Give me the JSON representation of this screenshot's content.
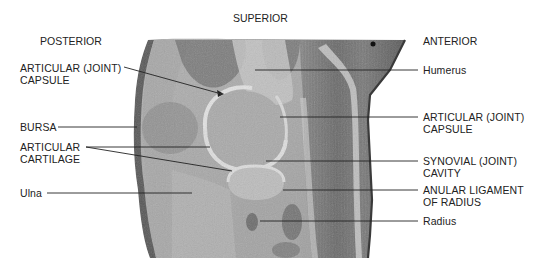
{
  "orientation": {
    "superior": "SUPERIOR",
    "posterior": "POSTERIOR",
    "anterior": "ANTERIOR"
  },
  "labels_left": [
    {
      "id": "articular-capsule-posterior",
      "lines": [
        "ARTICULAR (JOINT)",
        "CAPSULE"
      ]
    },
    {
      "id": "bursa",
      "lines": [
        "BURSA"
      ]
    },
    {
      "id": "articular-cartilage",
      "lines": [
        "ARTICULAR",
        "CARTILAGE"
      ]
    },
    {
      "id": "ulna",
      "lines": [
        "Ulna"
      ]
    }
  ],
  "labels_right": [
    {
      "id": "humerus",
      "lines": [
        "Humerus"
      ]
    },
    {
      "id": "articular-capsule-anterior",
      "lines": [
        "ARTICULAR (JOINT)",
        "CAPSULE"
      ]
    },
    {
      "id": "synovial-cavity",
      "lines": [
        "SYNOVIAL (JOINT)",
        "CAVITY"
      ]
    },
    {
      "id": "anular-ligament",
      "lines": [
        "ANULAR LIGAMENT",
        "OF RADIUS"
      ]
    },
    {
      "id": "radius",
      "lines": [
        "Radius"
      ]
    }
  ],
  "colors": {
    "background": "#ffffff",
    "tissue_light": "#b8b8b8",
    "tissue_mid": "#8f8f8f",
    "tissue_dark": "#5e5e5e",
    "cartilage": "#d6d6d6",
    "leader_line": "#222222"
  }
}
